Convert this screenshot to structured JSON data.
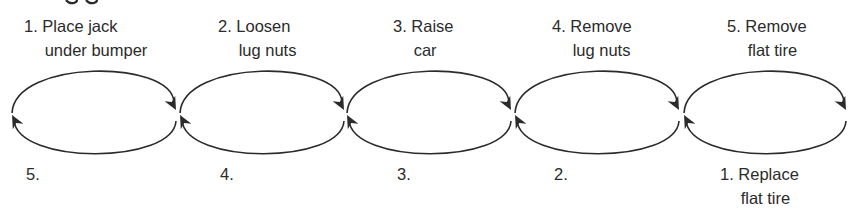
{
  "diagram": {
    "colors": {
      "stroke": "#2b2b2b",
      "text": "#2b2b2b",
      "background": "#ffffff"
    },
    "top_labels": [
      {
        "number": "1.",
        "line1": "Place jack",
        "line2": "under bumper",
        "x": 24,
        "y": 14
      },
      {
        "number": "2.",
        "line1": "Loosen",
        "line2": "lug nuts",
        "x": 218,
        "y": 14
      },
      {
        "number": "3.",
        "line1": "Raise",
        "line2": "car",
        "x": 393,
        "y": 14
      },
      {
        "number": "4.",
        "line1": "Remove",
        "line2": "lug nuts",
        "x": 552,
        "y": 14
      },
      {
        "number": "5.",
        "line1": "Remove",
        "line2": "flat tire",
        "x": 727,
        "y": 14
      }
    ],
    "bottom_labels": [
      {
        "number": "5.",
        "line1": "",
        "line2": "",
        "x": 26,
        "y": 162
      },
      {
        "number": "4.",
        "line1": "",
        "line2": "",
        "x": 220,
        "y": 162
      },
      {
        "number": "3.",
        "line1": "",
        "line2": "",
        "x": 397,
        "y": 162
      },
      {
        "number": "2.",
        "line1": "",
        "line2": "",
        "x": 554,
        "y": 162
      },
      {
        "number": "1.",
        "line1": "Replace",
        "line2": "flat tire",
        "x": 720,
        "y": 162
      }
    ],
    "cycles": [
      {
        "cx": 94,
        "cy": 112,
        "rx": 83,
        "ry": 40
      },
      {
        "cx": 262,
        "cy": 112,
        "rx": 83,
        "ry": 40
      },
      {
        "cx": 429,
        "cy": 112,
        "rx": 83,
        "ry": 40
      },
      {
        "cx": 597,
        "cy": 112,
        "rx": 83,
        "ry": 40
      },
      {
        "cx": 765,
        "cy": 112,
        "rx": 82,
        "ry": 40
      }
    ]
  }
}
